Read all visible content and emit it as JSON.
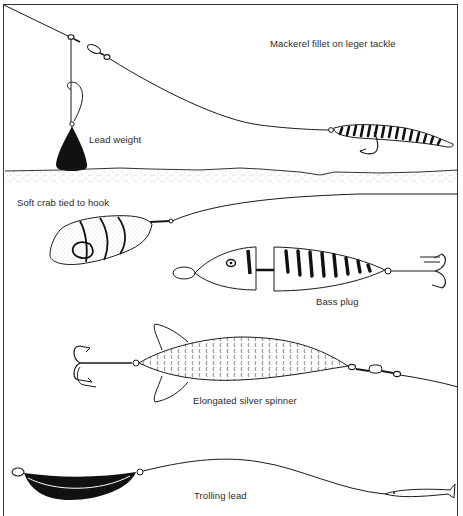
{
  "diagram": {
    "colors": {
      "ink": "#1a1a1a",
      "paper": "#ffffff",
      "frame": "#333333"
    },
    "panels": [
      {
        "id": "leger",
        "labels": {
          "rig": "Mackerel fillet on leger tackle",
          "weight": "Lead weight"
        }
      },
      {
        "id": "crab-plug",
        "labels": {
          "crab": "Soft crab tied to hook",
          "plug": "Bass plug"
        }
      },
      {
        "id": "spinner",
        "labels": {
          "spinner": "Elongated silver spinner"
        }
      },
      {
        "id": "trolling",
        "labels": {
          "lead": "Trolling lead"
        }
      }
    ]
  }
}
